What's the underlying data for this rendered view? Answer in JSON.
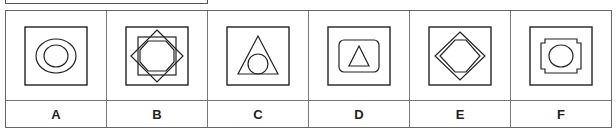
{
  "options": [
    {
      "label": "A",
      "shape": "square-with-concentric-ovals"
    },
    {
      "label": "B",
      "shape": "square-with-eight-point-star-and-octagon"
    },
    {
      "label": "C",
      "shape": "square-with-triangle-and-inscribed-circle"
    },
    {
      "label": "D",
      "shape": "square-with-rounded-square-and-triangle"
    },
    {
      "label": "E",
      "shape": "square-with-diamond-and-inner-hexagon"
    },
    {
      "label": "F",
      "shape": "square-with-notched-square-and-circle"
    }
  ]
}
